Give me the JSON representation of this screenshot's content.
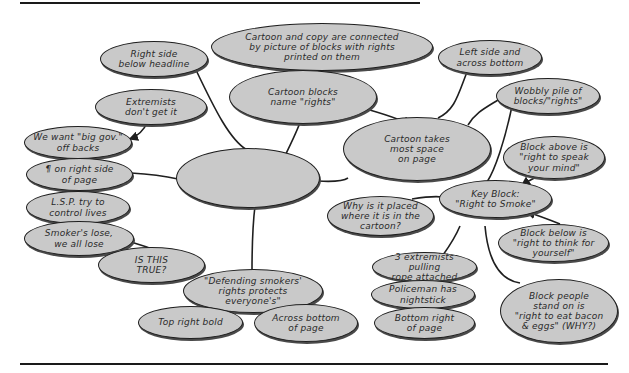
{
  "diagram": {
    "center": "Copy is limited",
    "nodes": {
      "cartoon_copy_connected": "Cartoon and copy are connected\nby picture of blocks with rights\nprinted on them",
      "right_side_below_headline": "Right side\nbelow headline",
      "extremists": "Extremists\ndon't get it",
      "big_gov": "We want \"big gov.\"\noff backs",
      "paragraph_right_side": "¶ on right side\nof page",
      "lsp": "L.S.P. try to\ncontrol lives",
      "smokers_lose": "Smoker's lose,\nwe all lose",
      "is_this_true": "IS THIS\nTRUE?",
      "cartoon_blocks_name": "Cartoon blocks\nname \"rights\"",
      "left_side_across_bottom": "Left side and\nacross bottom",
      "cartoon_takes_space": "Cartoon takes\nmost space\non page",
      "wobbly_pile": "Wobbly pile of\nblocks/\"rights\"",
      "block_above": "Block above is\n\"right to speak\nyour mind\"",
      "key_block": "Key Block:\n\"Right to Smoke\"",
      "why_placed": "Why is it placed\nwhere it is in the\ncartoon?",
      "block_below": "Block below is\n\"right to think for\nyourself\"",
      "extremists_rope": "3 extremists pulling\nrope attached",
      "policeman": "Policeman has\nnightstick",
      "bottom_right": "Bottom right\nof page",
      "block_people_stand": "Block people\nstand on is\n\"right to eat bacon\n& eggs\" (WHY?)",
      "defending_smokers": "\"Defending smokers'\nrights protects\neveryone's\"",
      "top_right_bold": "Top right bold",
      "across_bottom": "Across bottom\nof page"
    },
    "colors": {
      "bubble_fill": "#c9c9c9",
      "ink": "#1f1f1f"
    }
  }
}
